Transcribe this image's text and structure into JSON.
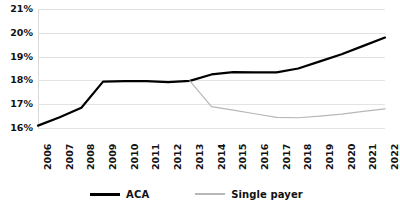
{
  "chart_data": {
    "type": "line",
    "title": "",
    "subtitle": "",
    "xlabel": "",
    "ylabel": "",
    "x": [
      2006,
      2007,
      2008,
      2009,
      2010,
      2011,
      2012,
      2013,
      2014,
      2015,
      2016,
      2017,
      2018,
      2019,
      2020,
      2021,
      2022
    ],
    "categories": [
      "2006",
      "2007",
      "2008",
      "2009",
      "2010",
      "2011",
      "2012",
      "2013",
      "2014",
      "2015",
      "2016",
      "2017",
      "2018",
      "2019",
      "2020",
      "2021",
      "2022"
    ],
    "ylim": [
      16,
      21
    ],
    "yticks": [
      16,
      17,
      18,
      19,
      20,
      21
    ],
    "ytick_labels": [
      "16%",
      "17%",
      "18%",
      "19%",
      "20%",
      "21%"
    ],
    "grid": true,
    "grid_axis": "y",
    "legend_position": "bottom",
    "series": [
      {
        "name": "ACA",
        "color": "#000000",
        "line_width": 2.2,
        "values": [
          16.1,
          16.45,
          16.85,
          17.95,
          17.97,
          17.97,
          17.93,
          17.98,
          18.25,
          18.35,
          18.34,
          18.34,
          18.5,
          18.8,
          19.1,
          19.45,
          19.8
        ]
      },
      {
        "name": "Single payer",
        "color": "#b7b7b7",
        "line_width": 1.2,
        "values": [
          null,
          null,
          null,
          null,
          null,
          null,
          null,
          17.98,
          16.9,
          16.75,
          16.6,
          16.45,
          16.43,
          16.5,
          16.58,
          16.7,
          16.8
        ]
      }
    ]
  },
  "legend": {
    "items": [
      {
        "label": "ACA",
        "color": "#000000"
      },
      {
        "label": "Single payer",
        "color": "#b7b7b7"
      }
    ]
  },
  "axes": {
    "y_tick_labels": [
      "21%",
      "20%",
      "19%",
      "18%",
      "17%",
      "16%"
    ],
    "x_tick_labels": [
      "2006",
      "2007",
      "2008",
      "2009",
      "2010",
      "2011",
      "2012",
      "2013",
      "2014",
      "2015",
      "2016",
      "2017",
      "2018",
      "2019",
      "2020",
      "2021",
      "2022"
    ]
  }
}
